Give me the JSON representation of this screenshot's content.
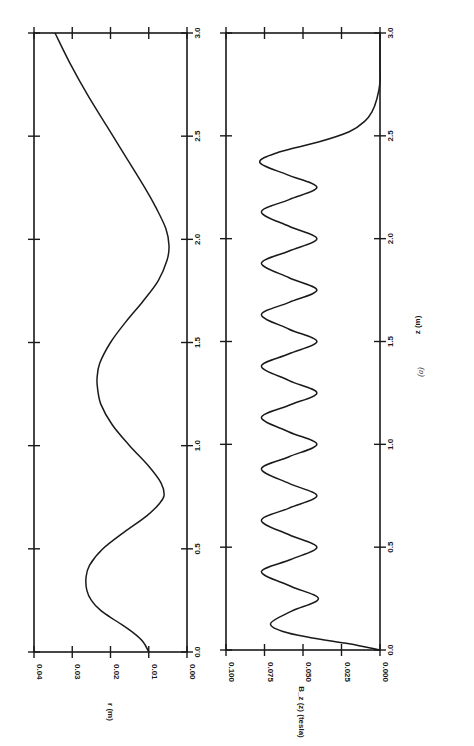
{
  "figure": {
    "caption": "(a)",
    "rotation_deg": -90
  },
  "chart_data": [
    {
      "type": "line",
      "panel": "top",
      "title": "",
      "xlabel": "z (m)",
      "ylabel": "r (m)",
      "xlim": [
        0.0,
        3.0
      ],
      "ylim": [
        0.0,
        0.04
      ],
      "xticks": [
        "0.0",
        "0.5",
        "1.0",
        "1.5",
        "2.0",
        "2.5",
        "3.0"
      ],
      "yticks": [
        "0.00",
        "0.01",
        "0.02",
        "0.03",
        "0.04"
      ],
      "grid": false,
      "series": [
        {
          "name": "r(z)",
          "x": [
            0.0,
            0.05,
            0.1,
            0.15,
            0.2,
            0.25,
            0.3,
            0.36,
            0.42,
            0.5,
            0.58,
            0.66,
            0.72,
            0.76,
            0.82,
            0.9,
            1.0,
            1.1,
            1.2,
            1.28,
            1.33,
            1.4,
            1.5,
            1.6,
            1.7,
            1.8,
            1.9,
            1.97,
            2.05,
            2.15,
            2.25,
            2.4,
            2.55,
            2.7,
            2.85,
            3.0
          ],
          "y": [
            0.01,
            0.0115,
            0.0145,
            0.0185,
            0.0225,
            0.025,
            0.0262,
            0.0264,
            0.0255,
            0.022,
            0.0165,
            0.0105,
            0.0072,
            0.006,
            0.0068,
            0.01,
            0.015,
            0.0195,
            0.0225,
            0.0234,
            0.0235,
            0.0228,
            0.02,
            0.016,
            0.0115,
            0.0075,
            0.0052,
            0.0047,
            0.0055,
            0.008,
            0.011,
            0.016,
            0.021,
            0.026,
            0.0305,
            0.0345
          ]
        }
      ]
    },
    {
      "type": "line",
      "panel": "bottom",
      "title": "",
      "xlabel": "z (m)",
      "ylabel": "B_z (z) (tesla)",
      "xlim": [
        0.0,
        3.0
      ],
      "ylim": [
        0.0,
        0.1
      ],
      "xticks": [
        "0.0",
        "0.5",
        "1.0",
        "1.5",
        "2.0",
        "2.5",
        "3.0"
      ],
      "yticks": [
        "0.000",
        "0.025",
        "0.050",
        "0.075",
        "0.100"
      ],
      "grid": false,
      "series": [
        {
          "name": "B_z(z)",
          "oscillation": {
            "period_m": 0.25,
            "peak_T": 0.077,
            "trough_T": 0.04,
            "first_peak_z": 0.13,
            "last_peak_z": 2.37,
            "decays_to_zero_z": 2.76
          },
          "x": [
            0.0,
            0.03,
            0.06,
            0.09,
            0.13,
            0.19,
            0.25,
            0.31,
            0.38,
            0.44,
            0.5,
            0.56,
            0.63,
            0.69,
            0.75,
            0.81,
            0.88,
            0.94,
            1.0,
            1.06,
            1.13,
            1.19,
            1.25,
            1.31,
            1.38,
            1.44,
            1.5,
            1.56,
            1.63,
            1.69,
            1.75,
            1.81,
            1.88,
            1.94,
            2.0,
            2.06,
            2.13,
            2.19,
            2.25,
            2.31,
            2.37,
            2.42,
            2.47,
            2.52,
            2.57,
            2.62,
            2.68,
            2.76,
            2.85,
            3.0
          ],
          "y": [
            0.0,
            0.02,
            0.045,
            0.063,
            0.071,
            0.057,
            0.04,
            0.058,
            0.077,
            0.058,
            0.041,
            0.059,
            0.077,
            0.059,
            0.041,
            0.059,
            0.077,
            0.059,
            0.041,
            0.059,
            0.077,
            0.059,
            0.041,
            0.059,
            0.077,
            0.059,
            0.041,
            0.059,
            0.077,
            0.059,
            0.041,
            0.059,
            0.077,
            0.059,
            0.041,
            0.059,
            0.077,
            0.059,
            0.041,
            0.06,
            0.078,
            0.066,
            0.04,
            0.02,
            0.01,
            0.005,
            0.002,
            0.0,
            0.0,
            0.0
          ]
        }
      ]
    }
  ]
}
